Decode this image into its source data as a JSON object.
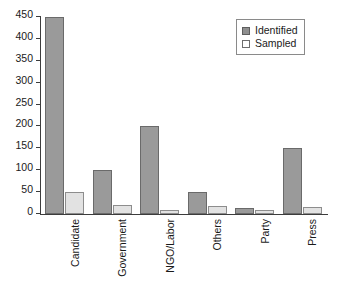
{
  "chart_data": {
    "type": "bar",
    "title": "",
    "subtitle": "",
    "xlabel": "",
    "ylabel": "",
    "grid": false,
    "legend_position": "top-right",
    "ylim": [
      0,
      450
    ],
    "ytick_labels": [
      "450",
      "400",
      "350",
      "300",
      "250",
      "200",
      "150",
      "100",
      "50",
      "0"
    ],
    "yticks": [
      450,
      400,
      350,
      300,
      250,
      200,
      150,
      100,
      50,
      0
    ],
    "categories": [
      "Candidate",
      "Government",
      "NGO/Labor",
      "Others",
      "Party",
      "Press"
    ],
    "series": [
      {
        "name": "Identified",
        "color": "#9a9a9a",
        "border_color": "#6a6a6a",
        "values": [
          450,
          100,
          200,
          50,
          13,
          150
        ]
      },
      {
        "name": "Sampled",
        "color": "#e2e2e2",
        "border_color": "#8d8d8d",
        "values": [
          50,
          20,
          10,
          18,
          9,
          17
        ]
      }
    ]
  },
  "legend": {
    "entries": [
      {
        "label": "Identified",
        "swatch": "filled-square-icon"
      },
      {
        "label": "Sampled",
        "swatch": "empty-square-icon"
      }
    ]
  },
  "axes": {
    "y_axis_name": "value-axis",
    "x_axis_name": "category-axis"
  }
}
